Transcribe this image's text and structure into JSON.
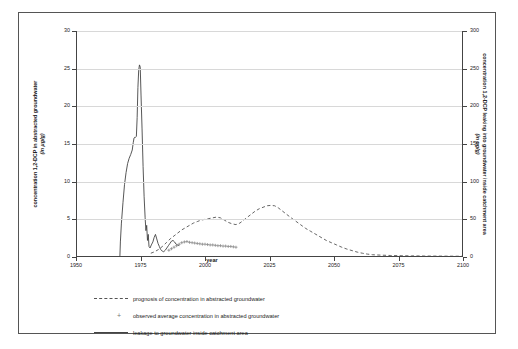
{
  "chart_data": {
    "type": "line",
    "title": "",
    "xlabel": "year",
    "ylabel_left": "concentration 1,2-DCP in abstracted groundwater",
    "ylabel_left_units": "(in µg/g)",
    "ylabel_right": "concentration 1,2-DCP leaking into groundwater inside catchment area",
    "ylabel_right_units": "(in µg/g)",
    "xlim": [
      1950,
      2100
    ],
    "ylim_left": [
      0,
      30
    ],
    "ylim_right": [
      0,
      300
    ],
    "xticks": [
      "1950",
      "1975",
      "2000",
      "2025",
      "2050",
      "2075",
      "2100"
    ],
    "xtick_values": [
      1950,
      1975,
      2000,
      2025,
      2050,
      2075,
      2100
    ],
    "yticks_left": [
      "0",
      "5",
      "10",
      "15",
      "20",
      "25",
      "30"
    ],
    "ytick_values_left": [
      0,
      5,
      10,
      15,
      20,
      25,
      30
    ],
    "yticks_right": [
      "0",
      "50",
      "100",
      "150",
      "200",
      "250",
      "300"
    ],
    "ytick_values_right": [
      0,
      50,
      100,
      150,
      200,
      250,
      300
    ],
    "grid": "horizontal",
    "legend_position": "below-plot",
    "series": [
      {
        "name": "leakage to groundwater inside catchment area",
        "style": "solid",
        "color": "#444444",
        "axis": "right",
        "points": [
          [
            1966.5,
            0
          ],
          [
            1967.0,
            0
          ],
          [
            1967.2,
            20
          ],
          [
            1967.6,
            45
          ],
          [
            1968.2,
            72
          ],
          [
            1968.8,
            96
          ],
          [
            1969.4,
            112
          ],
          [
            1970.0,
            124
          ],
          [
            1970.6,
            131
          ],
          [
            1971.2,
            136
          ],
          [
            1971.8,
            142
          ],
          [
            1972.2,
            152
          ],
          [
            1972.5,
            158
          ],
          [
            1972.8,
            159
          ],
          [
            1973.1,
            159
          ],
          [
            1973.4,
            160
          ],
          [
            1973.7,
            185
          ],
          [
            1974.0,
            225
          ],
          [
            1974.3,
            248
          ],
          [
            1974.6,
            255
          ],
          [
            1974.9,
            252
          ],
          [
            1975.2,
            215
          ],
          [
            1975.6,
            170
          ],
          [
            1976.0,
            120
          ],
          [
            1976.4,
            80
          ],
          [
            1976.8,
            52
          ],
          [
            1977.1,
            35
          ],
          [
            1977.4,
            42
          ],
          [
            1977.7,
            22
          ],
          [
            1978.0,
            30
          ],
          [
            1978.3,
            14
          ],
          [
            1978.7,
            12
          ],
          [
            1979.2,
            16
          ],
          [
            1979.8,
            20
          ],
          [
            1980.3,
            26
          ],
          [
            1980.8,
            30
          ],
          [
            1981.3,
            24
          ],
          [
            1981.8,
            18
          ],
          [
            1982.3,
            14
          ],
          [
            1982.8,
            10
          ],
          [
            1983.4,
            8
          ],
          [
            1984.0,
            7
          ],
          [
            1984.6,
            9
          ],
          [
            1985.2,
            12
          ],
          [
            1985.8,
            15
          ],
          [
            1986.4,
            18
          ],
          [
            1987.0,
            21
          ],
          [
            1987.6,
            22
          ],
          [
            1988.2,
            20
          ],
          [
            1988.8,
            17
          ],
          [
            1989.4,
            16
          ],
          [
            1990.0,
            15
          ]
        ]
      },
      {
        "name": "prognosis of concentration in abstracted groundwater",
        "style": "dashed",
        "color": "#555555",
        "axis": "left",
        "points": [
          [
            1979.0,
            0.5
          ],
          [
            1980.5,
            0.7
          ],
          [
            1982.0,
            1.0
          ],
          [
            1983.5,
            1.4
          ],
          [
            1985.0,
            1.9
          ],
          [
            1986.5,
            2.4
          ],
          [
            1988.0,
            2.8
          ],
          [
            1989.5,
            3.2
          ],
          [
            1991.0,
            3.6
          ],
          [
            1992.5,
            3.9
          ],
          [
            1994.0,
            4.2
          ],
          [
            1995.5,
            4.5
          ],
          [
            1997.0,
            4.7
          ],
          [
            1998.5,
            4.9
          ],
          [
            2000.0,
            5.0
          ],
          [
            2001.5,
            5.1
          ],
          [
            2003.0,
            5.2
          ],
          [
            2004.5,
            5.3
          ],
          [
            2006.0,
            5.2
          ],
          [
            2007.5,
            4.9
          ],
          [
            2009.0,
            4.6
          ],
          [
            2010.5,
            4.4
          ],
          [
            2012.0,
            4.3
          ],
          [
            2013.5,
            4.5
          ],
          [
            2015.0,
            4.9
          ],
          [
            2016.5,
            5.3
          ],
          [
            2018.0,
            5.7
          ],
          [
            2019.5,
            6.1
          ],
          [
            2021.0,
            6.4
          ],
          [
            2022.5,
            6.6
          ],
          [
            2024.0,
            6.8
          ],
          [
            2025.5,
            6.85
          ],
          [
            2027.0,
            6.8
          ],
          [
            2028.5,
            6.5
          ],
          [
            2030.0,
            6.1
          ],
          [
            2031.5,
            5.7
          ],
          [
            2033.0,
            5.3
          ],
          [
            2035.0,
            4.8
          ],
          [
            2037.0,
            4.3
          ],
          [
            2039.0,
            3.8
          ],
          [
            2041.0,
            3.4
          ],
          [
            2043.0,
            3.0
          ],
          [
            2045.0,
            2.6
          ],
          [
            2047.0,
            2.2
          ],
          [
            2049.0,
            1.9
          ],
          [
            2051.0,
            1.6
          ],
          [
            2053.0,
            1.3
          ],
          [
            2055.0,
            1.05
          ],
          [
            2057.0,
            0.85
          ],
          [
            2059.0,
            0.65
          ],
          [
            2061.0,
            0.5
          ],
          [
            2063.0,
            0.38
          ],
          [
            2065.0,
            0.3
          ],
          [
            2068.0,
            0.25
          ],
          [
            2072.0,
            0.2
          ],
          [
            2076.0,
            0.17
          ],
          [
            2080.0,
            0.15
          ],
          [
            2085.0,
            0.13
          ],
          [
            2090.0,
            0.12
          ],
          [
            2095.0,
            0.11
          ],
          [
            2100.0,
            0.1
          ]
        ]
      },
      {
        "name": "observed average concentration in abstracted groundwater",
        "style": "plus-markers",
        "color": "#8a8a8a",
        "axis": "left",
        "points": [
          [
            1986.0,
            0.9
          ],
          [
            1987.0,
            1.1
          ],
          [
            1988.0,
            1.3
          ],
          [
            1989.0,
            1.5
          ],
          [
            1990.0,
            1.7
          ],
          [
            1991.0,
            1.9
          ],
          [
            1992.0,
            2.0
          ],
          [
            1993.0,
            2.05
          ],
          [
            1994.0,
            1.95
          ],
          [
            1995.0,
            1.9
          ],
          [
            1996.0,
            1.85
          ],
          [
            1997.0,
            1.8
          ],
          [
            1998.0,
            1.75
          ],
          [
            1999.0,
            1.7
          ],
          [
            2000.0,
            1.7
          ],
          [
            2001.0,
            1.65
          ],
          [
            2002.0,
            1.6
          ],
          [
            2003.0,
            1.6
          ],
          [
            2004.0,
            1.55
          ],
          [
            2005.0,
            1.5
          ],
          [
            2006.0,
            1.5
          ],
          [
            2007.0,
            1.45
          ],
          [
            2008.0,
            1.45
          ],
          [
            2009.0,
            1.4
          ],
          [
            2010.0,
            1.4
          ],
          [
            2011.0,
            1.35
          ],
          [
            2012.0,
            1.3
          ]
        ]
      }
    ]
  },
  "legend": {
    "items": [
      {
        "marker": "dashed-line",
        "label": "prognosis of concentration in abstracted groundwater"
      },
      {
        "marker": "plus-symbol",
        "label": "observed average concentration in abstracted groundwater"
      },
      {
        "marker": "solid-line",
        "label": "leakage to groundwater inside catchment area"
      }
    ]
  },
  "colors": {
    "solid_series": "#444444",
    "dashed_series": "#555555",
    "marker_series": "#8a8a8a",
    "gridline": "#d8d8d8",
    "axis": "#444444",
    "frame": "#555555"
  }
}
